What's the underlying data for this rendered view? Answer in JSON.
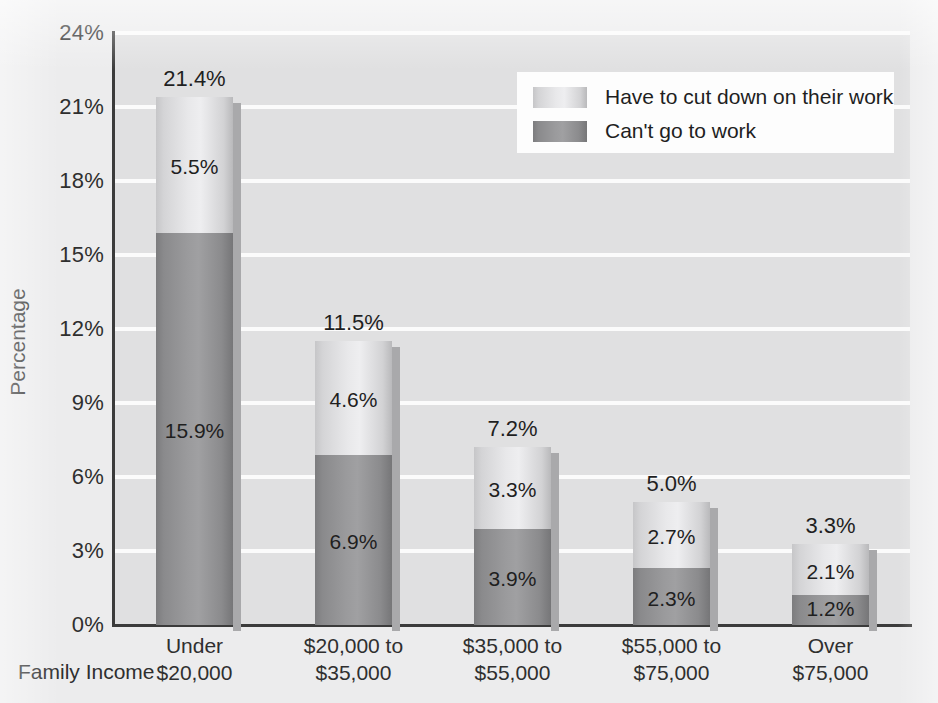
{
  "chart_data": {
    "type": "bar",
    "subtype": "stacked-vertical",
    "title": "",
    "xlabel": "Family Income",
    "ylabel": "Percentage",
    "categories": [
      "Under $20,000",
      "$20,000 to $35,000",
      "$35,000 to $55,000",
      "$55,000 to $75,000",
      "Over $75,000"
    ],
    "category_lines": [
      [
        "Under",
        "$20,000"
      ],
      [
        "$20,000 to",
        "$35,000"
      ],
      [
        "$35,000 to",
        "$55,000"
      ],
      [
        "$55,000 to",
        "$75,000"
      ],
      [
        "Over",
        "$75,000"
      ]
    ],
    "series": [
      {
        "name": "Can't go to work",
        "color": "#909092",
        "values": [
          15.9,
          6.9,
          3.9,
          2.3,
          1.2
        ],
        "labels": [
          "15.9%",
          "6.9%",
          "3.9%",
          "2.3%",
          "1.2%"
        ]
      },
      {
        "name": "Have to cut down on their work",
        "color": "#dededf",
        "values": [
          5.5,
          4.6,
          3.3,
          2.7,
          2.1
        ],
        "labels": [
          "5.5%",
          "4.6%",
          "3.3%",
          "2.7%",
          "2.1%"
        ]
      }
    ],
    "totals": [
      21.4,
      11.5,
      7.2,
      5.0,
      3.3
    ],
    "total_labels": [
      "21.4%",
      "11.5%",
      "7.2%",
      "5.0%",
      "3.3%"
    ],
    "ylim": [
      0,
      24
    ],
    "ytick_values": [
      0,
      3,
      6,
      9,
      12,
      15,
      18,
      21,
      24
    ],
    "ytick_labels": [
      "0%",
      "3%",
      "6%",
      "9%",
      "12%",
      "15%",
      "18%",
      "21%",
      "24%"
    ],
    "grid": "horizontal",
    "legend_position": "top-right",
    "legend": [
      {
        "label": "Have to cut down on their work",
        "swatch": "#dededf"
      },
      {
        "label": "Can't go to work",
        "swatch": "#909092"
      }
    ],
    "colors": {
      "plot_background": "#e0e0e1",
      "figure_background": "#ececed",
      "gridline": "#fbfbfb",
      "axis": "#3b3b3b",
      "text": "#2f2f2f",
      "legend_background": "#fdfdfd",
      "bar_light": "#dededf",
      "bar_dark": "#909092",
      "bar_shadow": "#a9a9ab"
    }
  }
}
